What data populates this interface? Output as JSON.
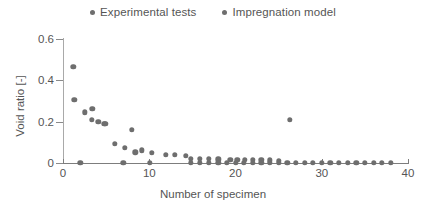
{
  "chart_data": {
    "type": "scatter",
    "title": "",
    "xlabel": "Number of specimen",
    "ylabel": "Void ratio [-]",
    "xlim": [
      0,
      40
    ],
    "ylim": [
      0,
      0.6
    ],
    "xticks": [
      0,
      10,
      20,
      30,
      40
    ],
    "xtick_labels": [
      "0",
      "10",
      "20",
      "30",
      "40"
    ],
    "yticks": [
      0,
      0.2,
      0.4,
      0.6
    ],
    "ytick_labels": [
      "0",
      "0.2",
      "0.4",
      "0.6"
    ],
    "grid": false,
    "legend_position": "top-center",
    "marker_color": "#6e6e6e",
    "series": [
      {
        "name": "Experimental tests",
        "marker": "circle",
        "color": "#6e6e6e",
        "points": [
          [
            1.2,
            0.465
          ],
          [
            1.3,
            0.305
          ],
          [
            2.5,
            0.245
          ],
          [
            3.4,
            0.262
          ],
          [
            3.3,
            0.208
          ],
          [
            4.1,
            0.198
          ],
          [
            4.8,
            0.19
          ],
          [
            4.9,
            0.188
          ],
          [
            8.0,
            0.16
          ],
          [
            6.0,
            0.092
          ],
          [
            7.2,
            0.072
          ],
          [
            8.4,
            0.052
          ],
          [
            9.1,
            0.062
          ],
          [
            10.3,
            0.05
          ],
          [
            11.9,
            0.04
          ],
          [
            13.0,
            0.038
          ],
          [
            14.2,
            0.035
          ],
          [
            14.8,
            0.022
          ],
          [
            15.9,
            0.02
          ],
          [
            16.9,
            0.02
          ],
          [
            18.0,
            0.018
          ],
          [
            19.4,
            0.017
          ],
          [
            20.2,
            0.016
          ],
          [
            21.1,
            0.016
          ],
          [
            22.0,
            0.015
          ],
          [
            23.0,
            0.014
          ],
          [
            24.0,
            0.013
          ],
          [
            25.0,
            0.012
          ],
          [
            26.3,
            0.208
          ]
        ]
      },
      {
        "name": "Impregnation model",
        "marker": "circle",
        "color": "#6e6e6e",
        "points": [
          [
            2.0,
            0.0
          ],
          [
            7.0,
            0.0
          ],
          [
            10.1,
            0.0
          ],
          [
            14.8,
            0.0
          ],
          [
            15.9,
            0.0
          ],
          [
            16.9,
            0.0
          ],
          [
            18.0,
            0.0
          ],
          [
            19.0,
            0.0
          ],
          [
            20.0,
            0.0
          ],
          [
            21.0,
            0.0
          ],
          [
            22.0,
            0.0
          ],
          [
            23.0,
            0.0
          ],
          [
            24.0,
            0.0
          ],
          [
            25.0,
            0.0
          ],
          [
            26.0,
            0.0
          ],
          [
            27.0,
            0.0
          ],
          [
            28.0,
            0.0
          ],
          [
            29.0,
            0.0
          ],
          [
            30.0,
            0.0
          ],
          [
            31.0,
            0.0
          ],
          [
            32.0,
            0.0
          ],
          [
            33.0,
            0.0
          ],
          [
            34.0,
            0.0
          ],
          [
            35.0,
            0.0
          ],
          [
            36.0,
            0.0
          ],
          [
            37.0,
            0.0
          ],
          [
            38.0,
            0.0
          ]
        ]
      }
    ]
  },
  "legend": {
    "entries": [
      {
        "label": "Experimental tests"
      },
      {
        "label": "Impregnation model"
      }
    ]
  },
  "axes": {
    "x_title": "Number of specimen",
    "y_title": "Void ratio [-]"
  }
}
